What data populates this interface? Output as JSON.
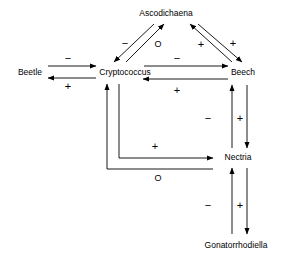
{
  "figure": {
    "type": "signed-interaction-network",
    "background_color": "#ffffff",
    "line_color": "#000000",
    "text_color": "#000000"
  },
  "nodes": [
    {
      "id": "ascodichaena",
      "label": "Ascodichaena",
      "x": 166,
      "y": 13
    },
    {
      "id": "beetle",
      "label": "Beetle",
      "x": 30,
      "y": 72
    },
    {
      "id": "cryptococcus",
      "label": "Cryptococcus",
      "x": 125,
      "y": 72
    },
    {
      "id": "beech",
      "label": "Beech",
      "x": 243,
      "y": 72
    },
    {
      "id": "nectria",
      "label": "Nectria",
      "x": 238,
      "y": 157
    },
    {
      "id": "gonatorrhodiella",
      "label": "Gonatorrhodiella",
      "x": 236,
      "y": 245
    }
  ],
  "edges": [
    {
      "id": "beetle-to-cryptococcus",
      "from": "Beetle",
      "to": "Cryptococcus",
      "sign": "−",
      "sign_x": 68,
      "sign_y": 58
    },
    {
      "id": "cryptococcus-to-beetle",
      "from": "Cryptococcus",
      "to": "Beetle",
      "sign": "+",
      "sign_x": 68,
      "sign_y": 86
    },
    {
      "id": "ascodichaena-to-cryptococcus",
      "from": "Ascodichaena",
      "to": "Cryptococcus",
      "sign": "−",
      "sign_x": 125,
      "sign_y": 43
    },
    {
      "id": "cryptococcus-to-ascodichaena",
      "from": "Cryptococcus",
      "to": "Ascodichaena",
      "sign": "O",
      "sign_x": 158,
      "sign_y": 44
    },
    {
      "id": "beech-to-ascodichaena",
      "from": "Beech",
      "to": "Ascodichaena",
      "sign": "+",
      "sign_x": 201,
      "sign_y": 44
    },
    {
      "id": "ascodichaena-to-beech",
      "from": "Ascodichaena",
      "to": "Beech",
      "sign": "+",
      "sign_x": 233,
      "sign_y": 43
    },
    {
      "id": "cryptococcus-to-beech",
      "from": "Cryptococcus",
      "to": "Beech",
      "sign": "−",
      "sign_x": 177,
      "sign_y": 58
    },
    {
      "id": "beech-to-cryptococcus",
      "from": "Beech",
      "to": "Cryptococcus",
      "sign": "+",
      "sign_x": 177,
      "sign_y": 90
    },
    {
      "id": "nectria-to-beech",
      "from": "Nectria",
      "to": "Beech",
      "sign": "−",
      "sign_x": 208,
      "sign_y": 118
    },
    {
      "id": "beech-to-nectria",
      "from": "Beech",
      "to": "Nectria",
      "sign": "+",
      "sign_x": 240,
      "sign_y": 118
    },
    {
      "id": "cryptococcus-to-nectria",
      "from": "Cryptococcus",
      "to": "Nectria",
      "sign": "+",
      "sign_x": 155,
      "sign_y": 146
    },
    {
      "id": "nectria-to-cryptococcus",
      "from": "Nectria",
      "to": "Cryptococcus",
      "sign": "O",
      "sign_x": 158,
      "sign_y": 178
    },
    {
      "id": "gonatorrhodiella-to-nectria",
      "from": "Gonatorrhodiella",
      "to": "Nectria",
      "sign": "−",
      "sign_x": 208,
      "sign_y": 205
    },
    {
      "id": "nectria-to-gonatorrhodiella",
      "from": "Nectria",
      "to": "Gonatorrhodiella",
      "sign": "+",
      "sign_x": 240,
      "sign_y": 205
    }
  ]
}
